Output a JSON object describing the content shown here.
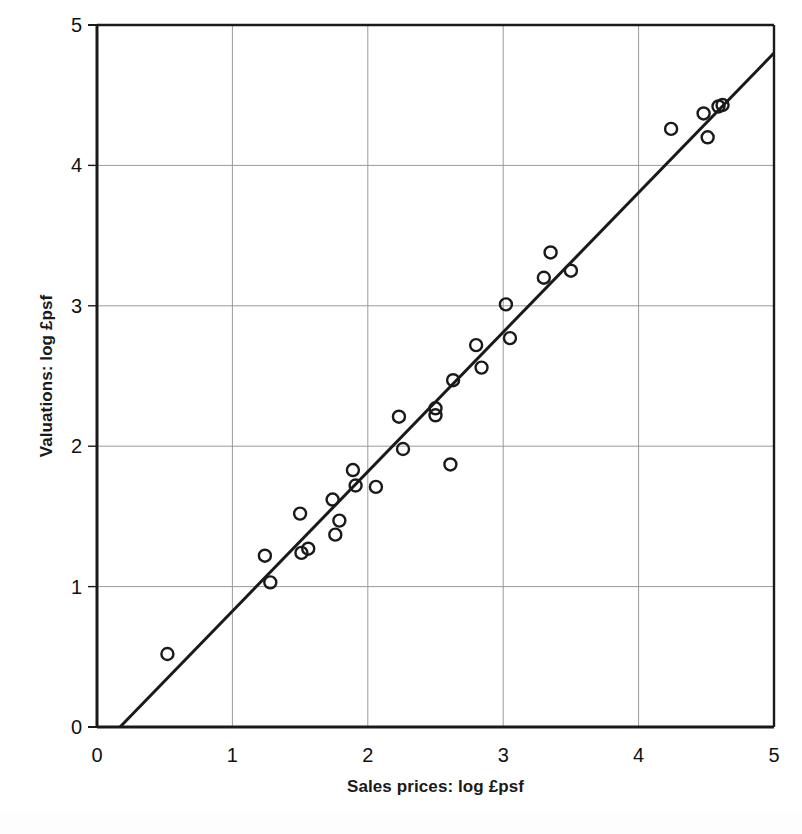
{
  "chart_data": {
    "type": "scatter",
    "title": "",
    "xlabel": "Sales prices: log £psf",
    "ylabel": "Valuations: log £psf",
    "xlim": [
      0,
      5
    ],
    "ylim": [
      0,
      5
    ],
    "xticks": [
      "0",
      "1",
      "2",
      "3",
      "4",
      "5"
    ],
    "yticks": [
      "0",
      "1",
      "2",
      "3",
      "4",
      "5"
    ],
    "xtick_values": [
      0,
      1,
      2,
      3,
      4,
      5
    ],
    "ytick_values": [
      0,
      1,
      2,
      3,
      4,
      5
    ],
    "grid": true,
    "grid_color": "#9a9a9a",
    "legend": null,
    "marker": {
      "shape": "open-circle",
      "edge_color": "#1a1a1a",
      "fill": "none",
      "radius_px": 6
    },
    "series": [
      {
        "name": "Valuations vs sales prices",
        "points": [
          [
            0.52,
            0.52
          ],
          [
            1.24,
            1.22
          ],
          [
            1.28,
            1.03
          ],
          [
            1.5,
            1.52
          ],
          [
            1.51,
            1.24
          ],
          [
            1.56,
            1.27
          ],
          [
            1.74,
            1.62
          ],
          [
            1.76,
            1.37
          ],
          [
            1.79,
            1.47
          ],
          [
            1.89,
            1.83
          ],
          [
            1.91,
            1.72
          ],
          [
            2.06,
            1.71
          ],
          [
            2.23,
            2.21
          ],
          [
            2.26,
            1.98
          ],
          [
            2.5,
            2.22
          ],
          [
            2.5,
            2.27
          ],
          [
            2.61,
            1.87
          ],
          [
            2.63,
            2.47
          ],
          [
            2.8,
            2.72
          ],
          [
            2.84,
            2.56
          ],
          [
            3.02,
            3.01
          ],
          [
            3.05,
            2.77
          ],
          [
            3.3,
            3.2
          ],
          [
            3.35,
            3.38
          ],
          [
            3.5,
            3.25
          ],
          [
            4.24,
            4.26
          ],
          [
            4.48,
            4.37
          ],
          [
            4.51,
            4.2
          ],
          [
            4.59,
            4.42
          ],
          [
            4.62,
            4.43
          ]
        ]
      }
    ],
    "fit_line": {
      "type": "linear",
      "x_start": 0.17,
      "y_start": 0.0,
      "x_end": 5.0,
      "y_end": 4.8,
      "color": "#1a1a1a",
      "width_px": 3
    }
  },
  "axis": {
    "y_title": "Valuations: log £psf",
    "x_title": "Sales prices: log £psf",
    "x_ticks": [
      "0",
      "1",
      "2",
      "3",
      "4",
      "5"
    ],
    "y_ticks": [
      "0",
      "1",
      "2",
      "3",
      "4",
      "5"
    ]
  }
}
